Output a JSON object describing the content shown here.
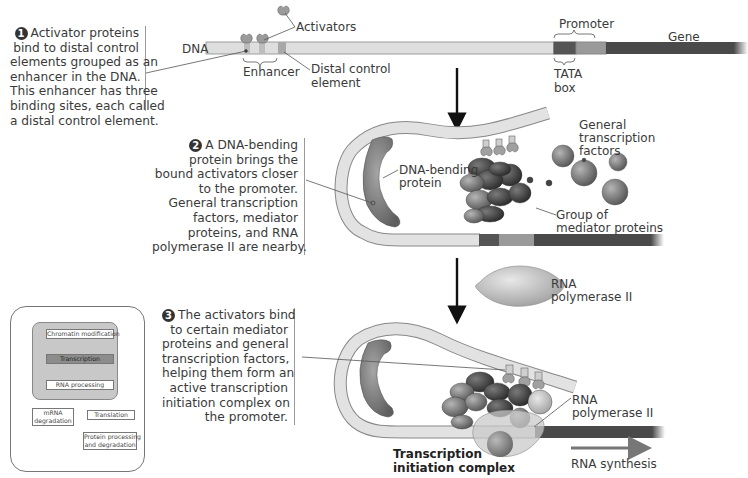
{
  "step1": {
    "number": "1",
    "lines": [
      "Activator proteins",
      "bind to distal control",
      "elements grouped as an",
      "enhancer in the DNA.",
      "This enhancer has three",
      "binding sites, each called",
      "a distal control element."
    ]
  },
  "step2": {
    "number": "2",
    "lines": [
      "A DNA-bending",
      "protein brings the",
      "bound activators closer",
      "to the promoter.",
      "General transcription",
      "factors, mediator",
      "proteins, and RNA",
      "polymerase II are nearby."
    ]
  },
  "step3": {
    "number": "3",
    "lines": [
      "The activators bind",
      "to certain mediator",
      "proteins and general",
      "transcription factors,",
      "helping them form an",
      "active transcription",
      "initiation complex on",
      "the promoter."
    ]
  },
  "labels": {
    "dna": "DNA",
    "activators": "Activators",
    "enhancer": "Enhancer",
    "distal_control_element_1": "Distal control",
    "distal_control_element_2": "element",
    "promoter": "Promoter",
    "tata_1": "TATA",
    "tata_2": "box",
    "gene": "Gene",
    "dna_bending_1": "DNA-bending",
    "dna_bending_2": "protein",
    "gtf_1": "General",
    "gtf_2": "transcription",
    "gtf_3": "factors",
    "mediator_1": "Group of",
    "mediator_2": "mediator proteins",
    "rnapol_1": "RNA",
    "rnapol_2": "polymerase II",
    "rnapol3_1": "RNA",
    "rnapol3_2": "polymerase II",
    "complex_1": "Transcription",
    "complex_2": "initiation complex",
    "rna_synthesis": "RNA synthesis"
  },
  "inset": {
    "boxes": {
      "chromatin": "Chromatin modification",
      "transcription": "Transcription",
      "rna_processing": "RNA processing",
      "mrna_degradation_1": "mRNA",
      "mrna_degradation_2": "degradation",
      "translation": "Translation",
      "protein_1": "Protein processing",
      "protein_2": "and degradation"
    }
  },
  "colors": {
    "dna_light": "#d9d9d9",
    "dna_dark": "#4a4a4a",
    "promoter_mid": "#8f8f8f",
    "protein_gray": "#7a7a7a",
    "text": "#3a3a3a",
    "background": "#ffffff"
  }
}
